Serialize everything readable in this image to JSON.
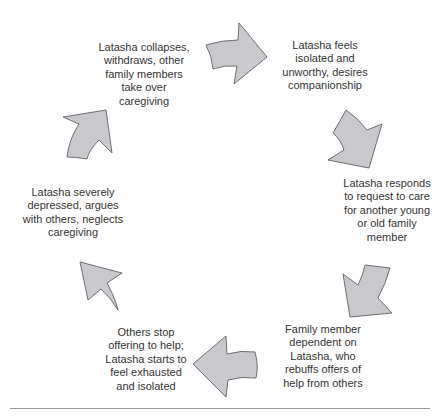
{
  "diagram": {
    "type": "cycle",
    "direction": "clockwise",
    "arrow_fill": "#c9c9cd",
    "arrow_stroke": "#6e6e72",
    "text_color": "#333333",
    "nodes": [
      {
        "id": "n1",
        "position": "top-right",
        "text": "Latasha feels\nisolated and\nunworthy, desires\ncompanionship"
      },
      {
        "id": "n2",
        "position": "right",
        "text": "Latasha responds\nto request to care\nfor another young\nor old family\nmember"
      },
      {
        "id": "n3",
        "position": "bottom-right",
        "text": "Family member\ndependent on\nLatasha, who\nrebuffs offers of\nhelp from others"
      },
      {
        "id": "n4",
        "position": "bottom-left",
        "text": "Others stop\noffering to help;\nLatasha starts to\nfeel exhausted\nand isolated"
      },
      {
        "id": "n5",
        "position": "left",
        "text": "Latasha severely\ndepressed, argues\nwith others, neglects\ncaregiving"
      },
      {
        "id": "n6",
        "position": "top-left",
        "text": "Latasha collapses,\nwithdraws, other\nfamily members\ntake over\ncaregiving"
      }
    ],
    "edges": [
      {
        "from": "n6",
        "to": "n1",
        "arrow_direction": "right"
      },
      {
        "from": "n1",
        "to": "n2",
        "arrow_direction": "down-right"
      },
      {
        "from": "n2",
        "to": "n3",
        "arrow_direction": "down-left"
      },
      {
        "from": "n3",
        "to": "n4",
        "arrow_direction": "left"
      },
      {
        "from": "n4",
        "to": "n5",
        "arrow_direction": "up-left"
      },
      {
        "from": "n5",
        "to": "n6",
        "arrow_direction": "up-right"
      }
    ]
  },
  "caption": {
    "text": ""
  }
}
